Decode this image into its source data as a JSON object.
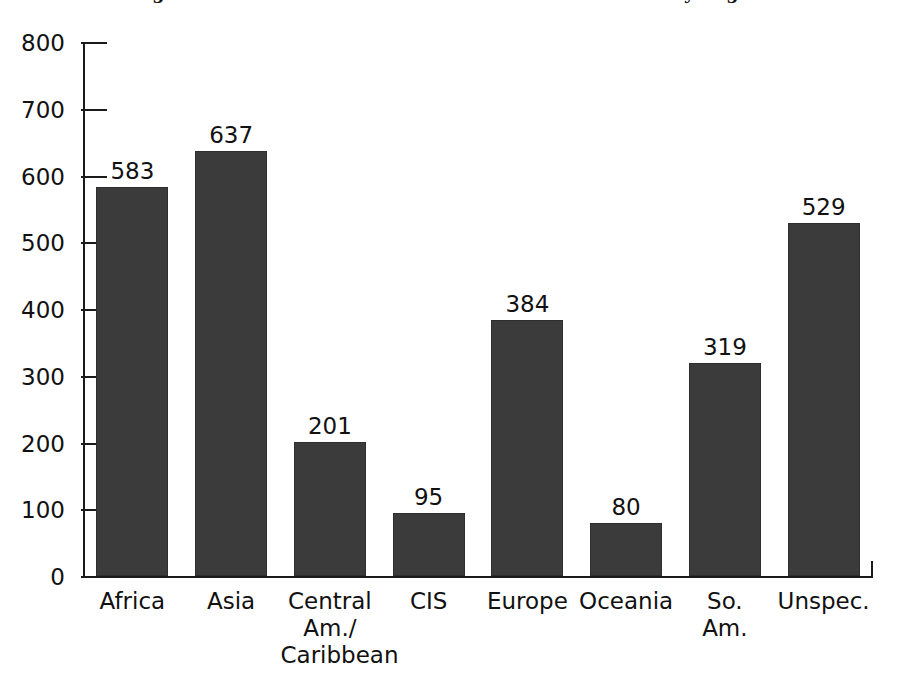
{
  "chart_data": {
    "type": "bar",
    "title": "Figure 1. Number of Full-Time Canadian Missionaries by Region",
    "xlabel": "",
    "ylabel": "",
    "ylim": [
      0,
      800
    ],
    "ytick_labels": [
      "800",
      "700",
      "600",
      "500",
      "400",
      "300",
      "200",
      "100",
      "0"
    ],
    "yticks": [
      800,
      700,
      600,
      500,
      400,
      300,
      200,
      100,
      0
    ],
    "grid": false,
    "legend": null,
    "bar_color": "#3b3b3b",
    "axis_color": "#1b1b1b",
    "background": "#ffffff",
    "categories": [
      "Africa",
      "Asia",
      "Central Am./ Caribbean",
      "CIS",
      "Europe",
      "Oceania",
      "So. Am.",
      "Unspec."
    ],
    "category_lines": [
      [
        "Africa"
      ],
      [
        "Asia"
      ],
      [
        "Central",
        "Am./",
        "Caribbean"
      ],
      [
        "CIS"
      ],
      [
        "Europe"
      ],
      [
        "Oceania"
      ],
      [
        "So.",
        "Am."
      ],
      [
        "Unspec."
      ]
    ],
    "values": [
      583,
      637,
      201,
      95,
      384,
      80,
      319,
      529
    ],
    "value_labels": [
      "583",
      "637",
      "201",
      "95",
      "384",
      "80",
      "319",
      "529"
    ]
  }
}
